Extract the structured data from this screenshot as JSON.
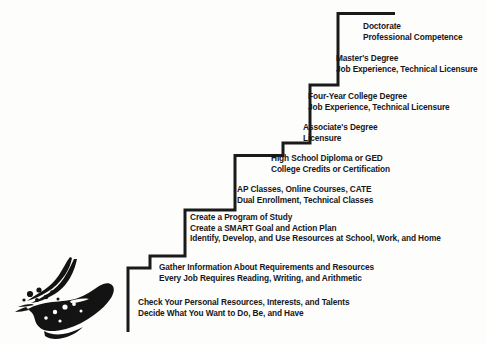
{
  "diagram": {
    "line_color": "#1a1a1a",
    "text_color": "#17171a",
    "background_color": "#fdfdfb",
    "steps": [
      {
        "id": "step-doctorate",
        "lines": [
          "Doctorate",
          "Professional Competence"
        ]
      },
      {
        "id": "step-masters",
        "lines": [
          "Master's Degree",
          "Job Experience, Technical Licensure"
        ]
      },
      {
        "id": "step-four-year-college",
        "lines": [
          "Four-Year College Degree",
          "Job Experience, Technical Licensure"
        ]
      },
      {
        "id": "step-associates",
        "lines": [
          "Associate's Degree",
          "Licensure"
        ]
      },
      {
        "id": "step-high-school-diploma",
        "lines": [
          "High School Diploma or GED",
          "College Credits or Certification"
        ]
      },
      {
        "id": "step-ap-classes",
        "lines": [
          "AP Classes, Online Courses, CATE",
          "Dual Enrollment, Technical Classes"
        ]
      },
      {
        "id": "step-program-of-study",
        "lines": [
          "Create a Program of Study",
          "Create a SMART Goal and Action Plan",
          "Identify, Develop, and Use Resources at School, Work, and Home"
        ]
      },
      {
        "id": "step-gather-information",
        "lines": [
          "Gather Information About Requirements and Resources",
          "Every Job Requires Reading, Writing, and Arithmetic"
        ]
      },
      {
        "id": "step-check-personal-resources",
        "lines": [
          "Check Your Personal Resources, Interests, and Talents",
          "Decide What You Want to Do, Be, and Have"
        ]
      }
    ]
  }
}
